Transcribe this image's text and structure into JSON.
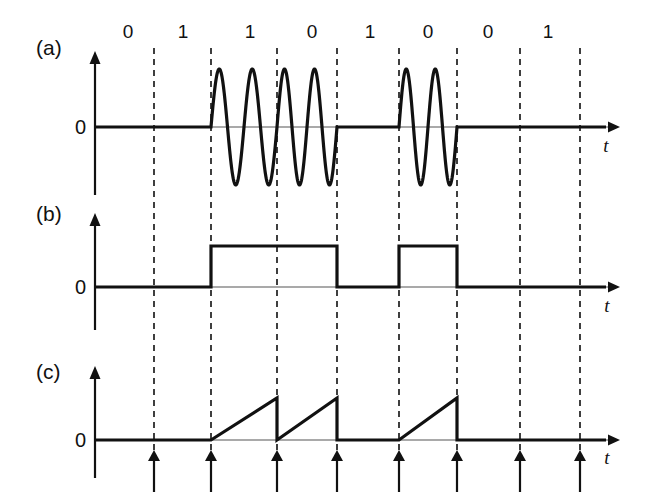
{
  "figure": {
    "title": "",
    "background_color": "#ffffff",
    "line_color": "#111111",
    "dash_color": "#2b2b2b",
    "baseline_color": "#555555",
    "width": 651,
    "height": 497
  },
  "bits": {
    "label_row_y": 38,
    "values": [
      "0",
      "1",
      "1",
      "0",
      "1",
      "0",
      "0",
      "1"
    ],
    "centers": [
      128,
      183,
      250,
      312,
      370,
      428,
      488,
      548
    ],
    "boundaries": [
      154,
      211,
      277,
      337,
      399,
      457,
      520,
      580
    ]
  },
  "panels": [
    {
      "id": "panel-a",
      "label": "(a)",
      "label_x": 36,
      "label_y": 55,
      "axis_x": 95,
      "zero_y": 127,
      "axis_top_y": 60,
      "axis_bottom_y": 195,
      "amplitude": 58,
      "axis_right_x": 620,
      "zero_label": "0",
      "zero_label_x": 86,
      "zero_label_y": 134,
      "t_label": "t",
      "t_label_x": 606,
      "t_label_y": 152,
      "waveform": "ask",
      "cycles_per_bit": 2
    },
    {
      "id": "panel-b",
      "label": "(b)",
      "label_x": 36,
      "label_y": 221,
      "axis_x": 95,
      "zero_y": 287,
      "axis_top_y": 222,
      "axis_bottom_y": 330,
      "amplitude": 41,
      "axis_right_x": 620,
      "zero_label": "0",
      "zero_label_x": 86,
      "zero_label_y": 294,
      "t_label": "t",
      "t_label_x": 607,
      "t_label_y": 312,
      "waveform": "square"
    },
    {
      "id": "panel-c",
      "label": "(c)",
      "label_x": 36,
      "label_y": 379,
      "axis_x": 95,
      "zero_y": 440,
      "axis_top_y": 375,
      "axis_bottom_y": 478,
      "amplitude": 42,
      "axis_right_x": 620,
      "zero_label": "0",
      "zero_label_x": 86,
      "zero_label_y": 447,
      "t_label": "t",
      "t_label_x": 607,
      "t_label_y": 464,
      "waveform": "ramp"
    }
  ],
  "dashed_lines": {
    "top_y": 48,
    "bottom_y": 455
  },
  "tick_arrows": {
    "y_base": 492,
    "y_tip": 450,
    "head_size": 6,
    "count": 8
  },
  "chart_data": {
    "type": "line",
    "title": "",
    "xlabel": "t",
    "ylabel": "0",
    "grid": true,
    "legend_position": "none",
    "bit_sequence": [
      0,
      1,
      1,
      0,
      1,
      0,
      0,
      1
    ],
    "series": [
      {
        "name": "(a) ASK modulated carrier",
        "description": "Two carrier cycles per bit interval when bit = 1, zero when bit = 0",
        "values": [
          0,
          1,
          1,
          0,
          1,
          0,
          0,
          1
        ]
      },
      {
        "name": "(b) Rectified / envelope square pulses",
        "description": "High level during bit = 1 intervals, zero during bit = 0 intervals",
        "values": [
          0,
          1,
          1,
          0,
          1,
          0,
          0,
          1
        ]
      },
      {
        "name": "(c) Integrator ramp output",
        "description": "Linear ramp rising across each bit = 1 interval then reset to zero; flat at zero for bit = 0",
        "values": [
          0,
          1,
          1,
          0,
          1,
          0,
          0,
          1
        ]
      }
    ]
  }
}
